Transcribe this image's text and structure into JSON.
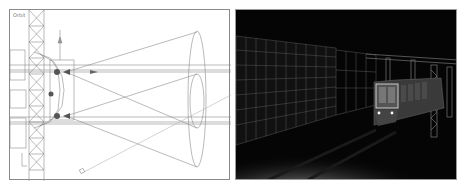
{
  "left_viewport": {
    "label": "Orbit",
    "mode": "wireframe",
    "background": "#ffffff",
    "line_color": "#808080",
    "objects": [
      "truss-tower",
      "spotlight-top",
      "spotlight-bottom",
      "light-cone-top",
      "light-cone-bottom",
      "camera-target",
      "axis-gizmo"
    ]
  },
  "right_viewport": {
    "mode": "rendered",
    "background": "#050505",
    "objects": [
      "wireframe-wall",
      "truss-gantries",
      "train",
      "rails",
      "headlight-pool"
    ]
  }
}
